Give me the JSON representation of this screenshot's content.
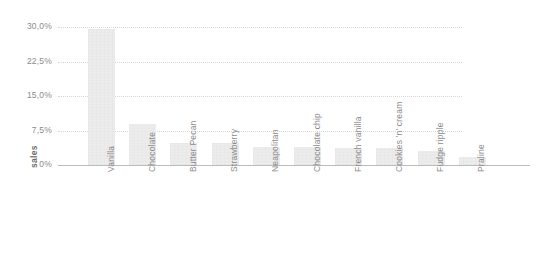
{
  "chart_data": {
    "type": "bar",
    "title": "",
    "subtitle": "",
    "xlabel": "",
    "ylabel": "sales",
    "categories": [
      "Vanilla",
      "Chocolate",
      "Butter Pecan",
      "Strawberry",
      "Neapolitan",
      "Chocolate chip",
      "French vanilla",
      "Cookies 'n' cream",
      "Fudge ripple",
      "Praline"
    ],
    "values": [
      29.5,
      9.0,
      4.8,
      4.8,
      4.0,
      4.0,
      3.8,
      3.8,
      3.1,
      1.8
    ],
    "value_unit": "%",
    "ylim": [
      0,
      30
    ],
    "ytick_values": [
      0,
      7.5,
      15,
      22.5,
      30
    ],
    "ytick_labels": [
      "0%",
      "7,5%",
      "15,0%",
      "22,5%",
      "30,0%"
    ],
    "grid": true,
    "grid_style": "dotted-horizontal",
    "legend": false,
    "legend_position": "none",
    "xtick_rotation": 90,
    "colors": {
      "bar_fill": "#ececec",
      "gridline": "#d8d8d8",
      "axis_line": "#bcbcbc",
      "tick_text": "#8c8c8c",
      "axis_title_text": "#6e6e6e",
      "background": "#ffffff"
    }
  }
}
